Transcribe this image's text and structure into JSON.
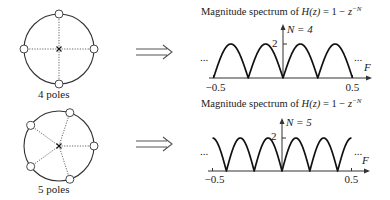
{
  "panels": [
    {
      "id": "n4",
      "pole_label": "4 poles",
      "num_poles": 4,
      "circle": {
        "cx": 59,
        "cy": 49,
        "r": 35
      },
      "pole_angles_deg": [
        0,
        90,
        180,
        270
      ],
      "label_pos": {
        "x": 38,
        "y": 89
      },
      "arrow": {
        "x1": 136,
        "x2": 172,
        "y": 52
      },
      "chart": {
        "title_prefix": "Magnitude spectrum of ",
        "title_func": "H(z)",
        "title_mid": " = 1 − ",
        "title_z": "z",
        "title_exp": "−N",
        "title_pos": {
          "x": 201,
          "y": 6
        },
        "n_label": "N = 4",
        "n_value": 4,
        "y_tick_label": "2",
        "x_min_label": "−0.5",
        "x_max_label": "0.5",
        "x_axis_label": "F",
        "ellipsis_left": "...",
        "ellipsis_right": "...",
        "origin": {
          "x": 283,
          "y": 78
        },
        "x_scale": 139,
        "peak_px": 34,
        "axis_left": 209,
        "axis_right": 372,
        "y_top": 24,
        "x_labels_y": 82,
        "ellipsis_left_pos": {
          "x": 200,
          "y": 52
        },
        "ellipsis_right_pos": {
          "x": 354,
          "y": 52
        },
        "f_label_pos": {
          "x": 364,
          "y": 62
        },
        "n_label_pos": {
          "x": 287,
          "y": 24
        },
        "tick_label_pos": {
          "x": 272,
          "y": 38
        }
      }
    },
    {
      "id": "n5",
      "pole_label": "5 poles",
      "num_poles": 5,
      "circle": {
        "cx": 59,
        "cy": 146,
        "r": 35
      },
      "pole_angles_deg": [
        0,
        72,
        144,
        216,
        288
      ],
      "label_pos": {
        "x": 38,
        "y": 184
      },
      "arrow": {
        "x1": 136,
        "x2": 172,
        "y": 144
      },
      "chart": {
        "title_prefix": "Magnitude spectrum of ",
        "title_func": "H(z)",
        "title_mid": " = 1 − ",
        "title_z": "z",
        "title_exp": "−N",
        "title_pos": {
          "x": 201,
          "y": 98
        },
        "n_label": "N = 5",
        "n_value": 5,
        "y_tick_label": "2",
        "x_min_label": "−0.5",
        "x_max_label": "0.5",
        "x_axis_label": "F",
        "ellipsis_left": "...",
        "ellipsis_right": "...",
        "origin": {
          "x": 282,
          "y": 171
        },
        "x_scale": 139,
        "peak_px": 33,
        "axis_left": 208,
        "axis_right": 370,
        "y_top": 118,
        "x_labels_y": 174,
        "ellipsis_left_pos": {
          "x": 200,
          "y": 146
        },
        "ellipsis_right_pos": {
          "x": 354,
          "y": 146
        },
        "f_label_pos": {
          "x": 362,
          "y": 155
        },
        "n_label_pos": {
          "x": 286,
          "y": 117
        },
        "tick_label_pos": {
          "x": 271,
          "y": 131
        }
      }
    }
  ],
  "colors": {
    "curve": "#111111",
    "circle": "#333333",
    "dotted": "#555555",
    "axis": "#333333",
    "arrow": "#555555"
  }
}
